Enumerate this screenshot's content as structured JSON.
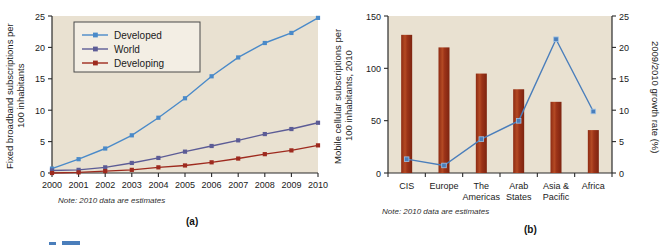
{
  "figure": {
    "background": "#ffffff",
    "plot_background": "#e9e1d1",
    "axis_color": "#2a2a2a"
  },
  "panel_a": {
    "letter": "(a)",
    "ylabel": "Fixed broadband subscriptions per\n100 inhabitants",
    "ylabel_line1": "Fixed broadband subscriptions per",
    "ylabel_line2": "100 inhabitants",
    "note": "Note: 2010 data are estimates",
    "legend": [
      {
        "label": "Developed",
        "color": "#4a8ac9"
      },
      {
        "label": "World",
        "color": "#5c5c96"
      },
      {
        "label": "Developing",
        "color": "#9e2a1e"
      }
    ]
  },
  "panel_b": {
    "letter": "(b)",
    "ylabel_left_line1": "Mobile cellular subscriptions per",
    "ylabel_left_line2": "100 inhabitants, 2010",
    "ylabel_right": "2009/2010 growth rate (%)",
    "note": "Note: 2010 data are estimates",
    "bar_color": "#a03318",
    "line_color": "#4a7ebb"
  },
  "chart_data": [
    {
      "type": "line",
      "id": "panel-a",
      "title": "",
      "xlabel": "",
      "ylabel": "Fixed broadband subscriptions per 100 inhabitants",
      "x": [
        2000,
        2001,
        2002,
        2003,
        2004,
        2005,
        2006,
        2007,
        2008,
        2009,
        2010
      ],
      "xticklabels": [
        "2000",
        "2001",
        "2002",
        "2003",
        "2004",
        "2005",
        "2006",
        "2007",
        "2008",
        "2009",
        "2010"
      ],
      "yticks": [
        0,
        5,
        10,
        15,
        20,
        25
      ],
      "ylim": [
        0,
        25
      ],
      "grid": false,
      "legend_position": "upper-left",
      "series": [
        {
          "name": "Developed",
          "color": "#4a8ac9",
          "values": [
            0.7,
            2.2,
            3.9,
            6.0,
            8.8,
            11.9,
            15.4,
            18.4,
            20.7,
            22.3,
            24.7
          ]
        },
        {
          "name": "World",
          "color": "#5c5c96",
          "values": [
            0.4,
            0.5,
            0.9,
            1.6,
            2.4,
            3.4,
            4.3,
            5.2,
            6.2,
            7.0,
            8.0
          ]
        },
        {
          "name": "Developing",
          "color": "#9e2a1e",
          "values": [
            0.0,
            0.1,
            0.3,
            0.5,
            0.9,
            1.2,
            1.7,
            2.3,
            3.0,
            3.6,
            4.4
          ]
        }
      ],
      "note": "Note: 2010 data are estimates"
    },
    {
      "type": "bar",
      "id": "panel-b",
      "title": "",
      "xlabel": "",
      "ylabel": "Mobile cellular subscriptions per 100 inhabitants, 2010",
      "ylabel_secondary": "2009/2010 growth rate (%)",
      "categories": [
        "CIS",
        "Europe",
        "The Americas",
        "Arab States",
        "Asia & Pacific",
        "Africa"
      ],
      "category_lines": [
        [
          "CIS",
          ""
        ],
        [
          "Europe",
          ""
        ],
        [
          "The",
          "Americas"
        ],
        [
          "Arab",
          "States"
        ],
        [
          "Asia &",
          "Pacific"
        ],
        [
          "Africa",
          ""
        ]
      ],
      "values": [
        132,
        120,
        95,
        80,
        68,
        41
      ],
      "bar_color": "#a03318",
      "yticks": [
        0,
        50,
        100,
        150
      ],
      "ylim": [
        0,
        150
      ],
      "secondary_series": {
        "name": "2009/2010 growth rate",
        "color": "#4a7ebb",
        "values": [
          2.2,
          1.2,
          5.4,
          8.3,
          21.3,
          9.8
        ],
        "yticks": [
          0,
          5,
          10,
          15,
          20,
          25
        ],
        "ylim": [
          0,
          25
        ]
      },
      "grid": false,
      "note": "Note: 2010 data are estimates"
    }
  ]
}
